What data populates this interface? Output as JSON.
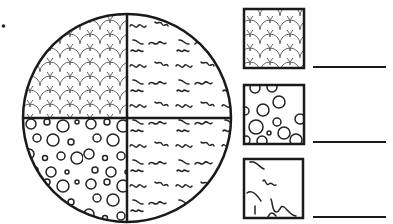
{
  "figure": {
    "type": "fraction-circle-matching-worksheet",
    "circle": {
      "sections": 4,
      "quadrants": [
        {
          "position": "top-left",
          "pattern": "scales"
        },
        {
          "position": "top-right",
          "pattern": "squiggles"
        },
        {
          "position": "bottom-left",
          "pattern": "circles"
        },
        {
          "position": "bottom-right",
          "pattern": "squiggles"
        }
      ]
    },
    "legend_boxes": [
      {
        "pattern": "scales",
        "answer": ""
      },
      {
        "pattern": "circles",
        "answer": ""
      },
      {
        "pattern": "squiggles",
        "answer": ""
      }
    ],
    "colors": {
      "ink": "#1a1a1a",
      "pattern_ink": "#555555",
      "background": "#ffffff"
    }
  }
}
